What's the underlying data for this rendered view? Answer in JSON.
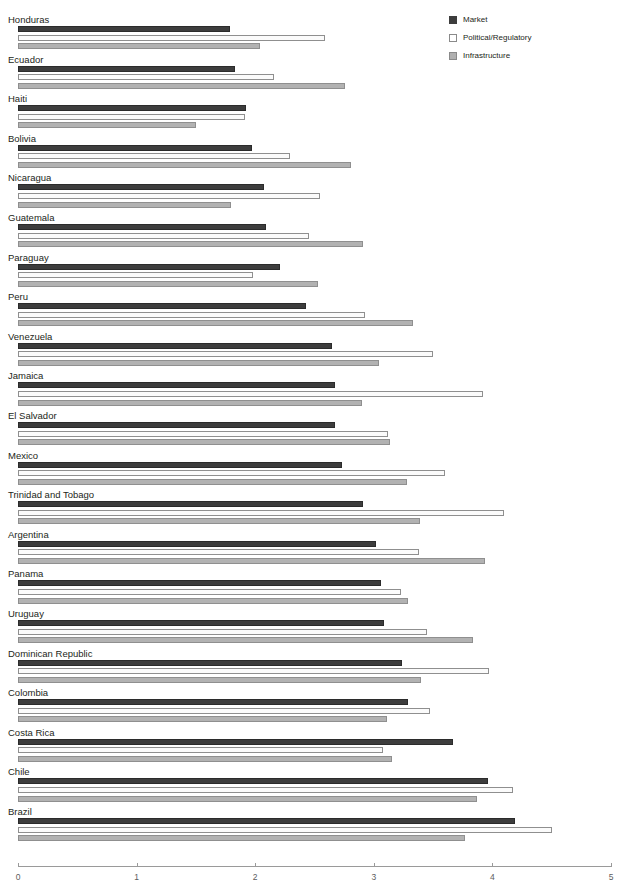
{
  "chart_data": {
    "type": "bar",
    "orientation": "horizontal",
    "title": "",
    "xlabel": "",
    "ylabel": "",
    "xlim": [
      0,
      5
    ],
    "xticks": [
      0,
      1,
      2,
      3,
      4,
      5
    ],
    "xtick_labels": [
      "0",
      "1",
      "2",
      "3",
      "4",
      "5"
    ],
    "grid": false,
    "legend_position": "top-right",
    "series": [
      {
        "name": "Market",
        "color": "#3d3d3d",
        "values": [
          1.79,
          1.83,
          1.92,
          1.97,
          2.07,
          2.09,
          2.21,
          2.43,
          2.65,
          2.67,
          2.67,
          2.73,
          2.91,
          3.02,
          3.06,
          3.09,
          3.24,
          3.29,
          3.67,
          3.96,
          4.19
        ]
      },
      {
        "name": "Political/Regulatory",
        "color": "#ffffff",
        "values": [
          2.59,
          2.16,
          1.91,
          2.29,
          2.55,
          2.45,
          1.98,
          2.93,
          3.5,
          3.92,
          3.12,
          3.6,
          4.1,
          3.38,
          3.23,
          3.45,
          3.97,
          3.47,
          3.08,
          4.17,
          4.5
        ]
      },
      {
        "name": "Infrastructure",
        "color": "#b2b2b2",
        "values": [
          2.04,
          2.76,
          1.5,
          2.81,
          1.8,
          2.91,
          2.53,
          3.33,
          3.04,
          2.9,
          3.14,
          3.28,
          3.39,
          3.94,
          3.29,
          3.84,
          3.4,
          3.11,
          3.15,
          3.87,
          3.77
        ]
      }
    ],
    "categories": [
      "Honduras",
      "Ecuador",
      "Haiti",
      "Bolivia",
      "Nicaragua",
      "Guatemala",
      "Paraguay",
      "Peru",
      "Venezuela",
      "Jamaica",
      "El Salvador",
      "Mexico",
      "Trinidad and Tobago",
      "Argentina",
      "Panama",
      "Uruguay",
      "Dominican Republic",
      "Colombia",
      "Costa Rica",
      "Chile",
      "Brazil"
    ]
  },
  "legend": {
    "items": [
      {
        "label": "Market",
        "swatch": "market-swatch"
      },
      {
        "label": "Political/Regulatory",
        "swatch": "political-swatch"
      },
      {
        "label": "Infrastructure",
        "swatch": "infrastructure-swatch"
      }
    ]
  }
}
